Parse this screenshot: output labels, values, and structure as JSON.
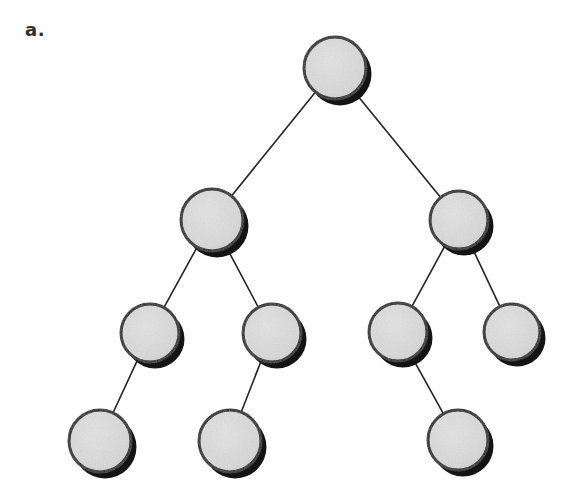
{
  "figure": {
    "label": "a.",
    "caption_label_text": "a.",
    "width": 586,
    "height": 504,
    "background_color": "#fefefe",
    "type": "binary-tree-diagram"
  },
  "style": {
    "node_fill_color": "#d9d9d9",
    "node_fill_color_light": "#e2e2e2",
    "node_outline_color": "#1c1c1c",
    "node_outline_width": 3,
    "node_shadow_color": "#141414",
    "node_shadow_offset_x": 5,
    "node_shadow_offset_y": 6,
    "edge_color": "#242424",
    "edge_width": 1.6,
    "label_color": "#2e2e2e"
  },
  "tree": {
    "node_count": 10,
    "edge_count": 9,
    "depth": 4,
    "nodes": [
      {
        "id": "n0",
        "level": 0,
        "cx": 335,
        "cy": 68,
        "r": 31,
        "label": ""
      },
      {
        "id": "n1",
        "level": 1,
        "cx": 212,
        "cy": 220,
        "r": 31,
        "label": ""
      },
      {
        "id": "n2",
        "level": 1,
        "cx": 459,
        "cy": 220,
        "r": 29,
        "label": ""
      },
      {
        "id": "n3",
        "level": 2,
        "cx": 150,
        "cy": 333,
        "r": 29,
        "label": ""
      },
      {
        "id": "n4",
        "level": 2,
        "cx": 272,
        "cy": 333,
        "r": 29,
        "label": ""
      },
      {
        "id": "n5",
        "level": 2,
        "cx": 398,
        "cy": 332,
        "r": 29,
        "label": ""
      },
      {
        "id": "n6",
        "level": 2,
        "cx": 512,
        "cy": 332,
        "r": 28,
        "label": ""
      },
      {
        "id": "n7",
        "level": 3,
        "cx": 100,
        "cy": 441,
        "r": 31,
        "label": ""
      },
      {
        "id": "n8",
        "level": 3,
        "cx": 230,
        "cy": 441,
        "r": 31,
        "label": ""
      },
      {
        "id": "n9",
        "level": 3,
        "cx": 458,
        "cy": 440,
        "r": 30,
        "label": ""
      }
    ],
    "edges": [
      {
        "from": "n0",
        "to": "n1"
      },
      {
        "from": "n0",
        "to": "n2"
      },
      {
        "from": "n1",
        "to": "n3"
      },
      {
        "from": "n1",
        "to": "n4"
      },
      {
        "from": "n2",
        "to": "n5"
      },
      {
        "from": "n2",
        "to": "n6"
      },
      {
        "from": "n3",
        "to": "n7"
      },
      {
        "from": "n4",
        "to": "n8"
      },
      {
        "from": "n5",
        "to": "n9"
      }
    ]
  }
}
